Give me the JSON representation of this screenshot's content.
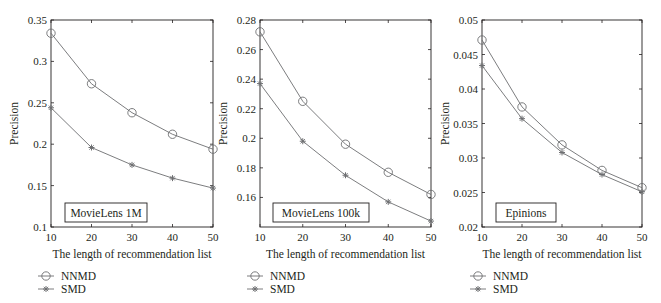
{
  "chart_data": [
    {
      "type": "line",
      "title": "MovieLens 1M",
      "xlabel": "The length of recommendation list",
      "ylabel": "Precision",
      "x": [
        10,
        20,
        30,
        40,
        50
      ],
      "xticks": [
        "10",
        "20",
        "30",
        "40",
        "50"
      ],
      "ylim": [
        0.1,
        0.35
      ],
      "yticks": [
        0.1,
        0.15,
        0.2,
        0.25,
        0.3,
        0.35
      ],
      "ytick_labels": [
        "0.1",
        "0.15",
        "0.2",
        "0.25",
        "0.3",
        "0.35"
      ],
      "series": [
        {
          "name": "NNMD",
          "marker": "circle",
          "values": [
            0.334,
            0.273,
            0.238,
            0.212,
            0.194
          ]
        },
        {
          "name": "SMD",
          "marker": "star",
          "values": [
            0.244,
            0.196,
            0.175,
            0.159,
            0.147
          ]
        }
      ],
      "annotation": "MovieLens 1M",
      "legend_position": "below",
      "grid": false
    },
    {
      "type": "line",
      "title": "MovieLens 100k",
      "xlabel": "The length of recommendation list",
      "ylabel": "Precision",
      "x": [
        10,
        20,
        30,
        40,
        50
      ],
      "xticks": [
        "10",
        "20",
        "30",
        "40",
        "50"
      ],
      "ylim": [
        0.14,
        0.28
      ],
      "yticks": [
        0.16,
        0.18,
        0.2,
        0.22,
        0.24,
        0.26,
        0.28
      ],
      "ytick_labels": [
        "0.16",
        "0.18",
        "0.2",
        "0.22",
        "0.24",
        "0.26",
        "0.28"
      ],
      "series": [
        {
          "name": "NNMD",
          "marker": "circle",
          "values": [
            0.272,
            0.225,
            0.196,
            0.177,
            0.162
          ]
        },
        {
          "name": "SMD",
          "marker": "star",
          "values": [
            0.237,
            0.198,
            0.175,
            0.157,
            0.144
          ]
        }
      ],
      "annotation": "MovieLens 100k",
      "legend_position": "below",
      "grid": false
    },
    {
      "type": "line",
      "title": "Epinions",
      "xlabel": "The length of recommendation list",
      "ylabel": "Precision",
      "x": [
        10,
        20,
        30,
        40,
        50
      ],
      "xticks": [
        "10",
        "20",
        "30",
        "40",
        "50"
      ],
      "ylim": [
        0.02,
        0.05
      ],
      "yticks": [
        0.02,
        0.025,
        0.03,
        0.035,
        0.04,
        0.045,
        0.05
      ],
      "ytick_labels": [
        "0.02",
        "0.025",
        "0.03",
        "0.035",
        "0.04",
        "0.045",
        "0.05"
      ],
      "series": [
        {
          "name": "NNMD",
          "marker": "circle",
          "values": [
            0.0471,
            0.0374,
            0.0319,
            0.0282,
            0.0257
          ]
        },
        {
          "name": "SMD",
          "marker": "star",
          "values": [
            0.0434,
            0.0357,
            0.0308,
            0.0276,
            0.0251
          ]
        }
      ],
      "annotation": "Epinions",
      "legend_position": "below",
      "grid": false
    }
  ],
  "colors": {
    "axis": "#231f20",
    "line": "#6d6e71"
  }
}
